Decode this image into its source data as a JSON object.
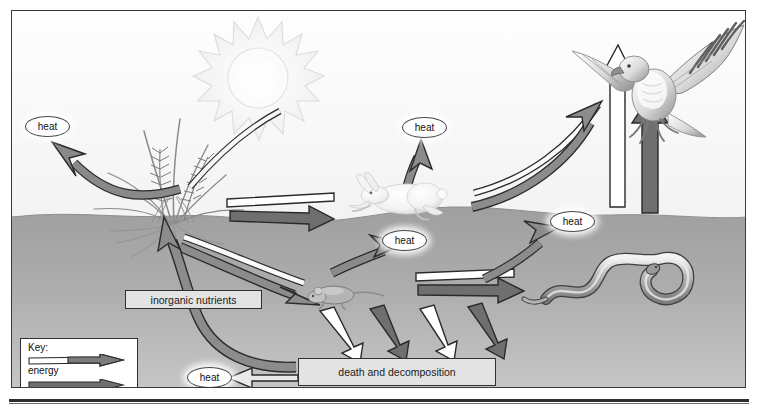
{
  "figure": {
    "frame_border_color": "#3a3a3a"
  },
  "colors": {
    "sky_top": "#fdfdfd",
    "sky_bottom": "#eeeeee",
    "ground": "#a9a9a9",
    "ground_deep": "#b9b9b9",
    "energy_arrow_fill": "#ffffff",
    "nutrient_arrow_fill": "#6f6f6f",
    "arrow_outline": "#2a2a2a",
    "box_fill": "#e3e3e3",
    "box_border": "#2f2f2f",
    "text": "#121212",
    "sun_fill": "#f6f6f6"
  },
  "boxes": {
    "inorganic_nutrients": "inorganic nutrients",
    "death_and_decomposition": "death and decomposition"
  },
  "heat_labels": {
    "plant": "heat",
    "rabbit": "heat",
    "mouse": "heat",
    "snake": "heat",
    "decomposition": "heat"
  },
  "key": {
    "title": "Key:",
    "items": [
      {
        "label": "energy",
        "arrow_style": "hollow",
        "fill": "#ffffff"
      },
      {
        "label": "nutrients",
        "arrow_style": "solid",
        "fill": "#6f6f6f"
      }
    ]
  },
  "organisms": [
    {
      "name": "sun",
      "role": "energy-source"
    },
    {
      "name": "plant",
      "role": "producer"
    },
    {
      "name": "rabbit",
      "role": "primary-consumer"
    },
    {
      "name": "mouse",
      "role": "primary-consumer"
    },
    {
      "name": "snake",
      "role": "secondary-consumer"
    },
    {
      "name": "hawk",
      "role": "tertiary-consumer"
    }
  ],
  "flows": [
    {
      "from": "sun",
      "to": "plant",
      "type": "energy"
    },
    {
      "from": "plant",
      "to": "heat",
      "type": "heat"
    },
    {
      "from": "plant",
      "to": "rabbit",
      "type": "energy"
    },
    {
      "from": "plant",
      "to": "rabbit",
      "type": "nutrients"
    },
    {
      "from": "plant",
      "to": "mouse",
      "type": "energy"
    },
    {
      "from": "plant",
      "to": "mouse",
      "type": "nutrients"
    },
    {
      "from": "rabbit",
      "to": "heat",
      "type": "heat"
    },
    {
      "from": "rabbit",
      "to": "hawk",
      "type": "energy"
    },
    {
      "from": "rabbit",
      "to": "hawk",
      "type": "nutrients"
    },
    {
      "from": "mouse",
      "to": "snake",
      "type": "energy"
    },
    {
      "from": "mouse",
      "to": "snake",
      "type": "nutrients"
    },
    {
      "from": "snake",
      "to": "hawk",
      "type": "energy"
    },
    {
      "from": "snake",
      "to": "hawk",
      "type": "nutrients"
    },
    {
      "from": "hawk",
      "to": "heat",
      "type": "heat"
    },
    {
      "from": "mouse",
      "to": "death_and_decomposition",
      "type": "energy"
    },
    {
      "from": "mouse",
      "to": "death_and_decomposition",
      "type": "nutrients"
    },
    {
      "from": "death_and_decomposition",
      "to": "heat",
      "type": "heat"
    },
    {
      "from": "death_and_decomposition",
      "to": "inorganic_nutrients",
      "type": "nutrients"
    },
    {
      "from": "inorganic_nutrients",
      "to": "plant",
      "type": "nutrients"
    }
  ]
}
